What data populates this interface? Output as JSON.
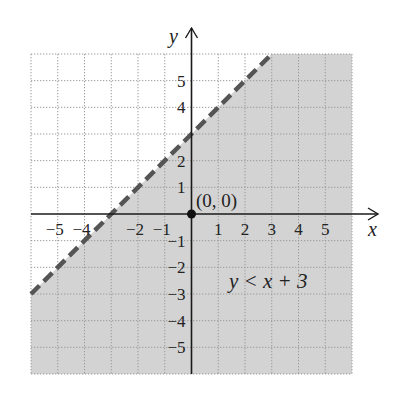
{
  "chart_data": {
    "type": "inequality_region",
    "title": "",
    "xlabel": "x",
    "ylabel": "y",
    "xlim": [
      -6,
      6
    ],
    "ylim": [
      -6,
      6
    ],
    "grid": true,
    "grid_style": "dotted",
    "x_ticks": [
      -5,
      -4,
      -2,
      -1,
      1,
      2,
      3,
      4,
      5
    ],
    "y_ticks": [
      5,
      4,
      2,
      1,
      -1,
      -2,
      -3,
      -4,
      -5
    ],
    "x_tick_labels": [
      "−5",
      "−4",
      "−2",
      "−1",
      "1",
      "2",
      "3",
      "4",
      "5"
    ],
    "y_tick_labels": [
      "5",
      "4",
      "2",
      "1",
      "−1",
      "−2",
      "−3",
      "−4",
      "−5"
    ],
    "boundary_line": {
      "equation": "y = x + 3",
      "slope": 1,
      "intercept": 3,
      "style": "dashed",
      "points": [
        [
          -6,
          -3
        ],
        [
          3,
          6
        ]
      ]
    },
    "shaded_region": "below boundary line",
    "inequality_label": "y < x + 3",
    "test_point": {
      "x": 0,
      "y": 0,
      "label": "(0, 0)"
    },
    "colors": {
      "shade": "#d3d3d3",
      "grid": "#9a9a9a",
      "boundary": "#555555",
      "axes": "#1a1a1a",
      "point": "#111111"
    }
  },
  "labels": {
    "x_axis": "x",
    "y_axis": "y",
    "inequality": "y < x + 3",
    "point": "(0, 0)"
  }
}
